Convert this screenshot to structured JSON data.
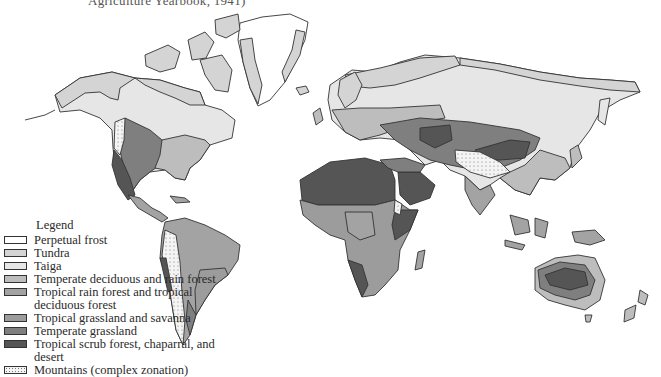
{
  "caption": "Agriculture Yearbook, 1941)",
  "legend": {
    "title": "Legend",
    "items": [
      {
        "label": "Perpetual frost",
        "color": "#ffffff",
        "pattern": "none"
      },
      {
        "label": "Tundra",
        "color": "#d4d4d4",
        "pattern": "none"
      },
      {
        "label": "Taiga",
        "color": "#e6e6e6",
        "pattern": "none"
      },
      {
        "label": "Temperate deciduous and rain forest",
        "color": "#bdbdbd",
        "pattern": "none"
      },
      {
        "label": "Tropical rain forest and tropical deciduous forest",
        "color": "#a3a3a3",
        "pattern": "none"
      },
      {
        "label": "Tropical grassland and savanna",
        "color": "#9c9c9c",
        "pattern": "none"
      },
      {
        "label": "Temperate grassland",
        "color": "#7f7f7f",
        "pattern": "none"
      },
      {
        "label": "Tropical scrub forest, chaparral, and desert",
        "color": "#555555",
        "pattern": "none"
      },
      {
        "label": "Mountains (complex zonation)",
        "color": "#f4f4f4",
        "pattern": "dots"
      }
    ]
  },
  "colors": {
    "outline": "#333333",
    "frost": "#ffffff",
    "tundra": "#d4d4d4",
    "taiga": "#e6e6e6",
    "temperate_forest": "#bdbdbd",
    "tropical_forest": "#a3a3a3",
    "savanna": "#9c9c9c",
    "grassland": "#7f7f7f",
    "desert": "#555555"
  }
}
